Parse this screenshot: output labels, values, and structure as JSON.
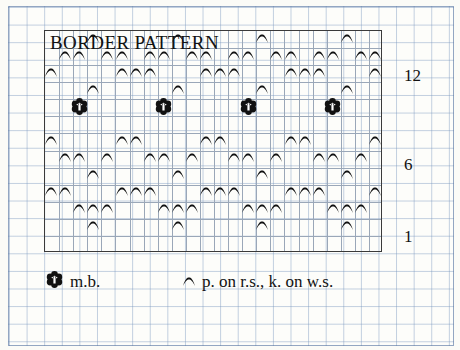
{
  "chart": {
    "title": "BORDER PATTERN",
    "row_labels": [
      {
        "text": "12",
        "row": 12
      },
      {
        "text": "6",
        "row": 6
      },
      {
        "text": "1",
        "row": 1
      }
    ],
    "grid": {
      "columns": 24,
      "rows": 13
    },
    "legend": [
      {
        "symbol": "m.b.-icon",
        "label": "m.b."
      },
      {
        "symbol": "purl-icon",
        "label": "p. on r.s., k. on w.s."
      }
    ]
  },
  "chart_data": {
    "type": "table",
    "title": "BORDER PATTERN",
    "xlabel": "",
    "ylabel": "",
    "symbols": {
      "purl": "p. on r.s., k. on w.s.",
      "bobble": "m.b."
    },
    "rows": [
      {
        "row": 13,
        "purl": [
          4,
          10,
          16,
          22
        ],
        "bobble": []
      },
      {
        "row": 12,
        "purl": [
          2,
          3,
          5,
          6,
          8,
          9,
          11,
          12,
          14,
          15,
          17,
          18,
          20,
          21,
          23,
          24
        ],
        "bobble": []
      },
      {
        "row": 11,
        "purl": [
          1,
          6,
          7,
          8,
          12,
          13,
          14,
          18,
          19,
          20,
          24
        ],
        "bobble": []
      },
      {
        "row": 10,
        "purl": [
          4,
          10,
          16,
          22
        ],
        "bobble": []
      },
      {
        "row": 9,
        "purl": [],
        "bobble": [
          3,
          9,
          15,
          21
        ]
      },
      {
        "row": 8,
        "purl": [],
        "bobble": []
      },
      {
        "row": 7,
        "purl": [
          1,
          6,
          7,
          12,
          13,
          18,
          19,
          24
        ],
        "bobble": []
      },
      {
        "row": 6,
        "purl": [
          2,
          3,
          5,
          8,
          9,
          11,
          14,
          15,
          17,
          20,
          21,
          23
        ],
        "bobble": []
      },
      {
        "row": 5,
        "purl": [
          4,
          10,
          16,
          22
        ],
        "bobble": []
      },
      {
        "row": 4,
        "purl": [
          1,
          2,
          6,
          7,
          8,
          12,
          13,
          14,
          18,
          19,
          20,
          24
        ],
        "bobble": []
      },
      {
        "row": 3,
        "purl": [
          3,
          4,
          5,
          9,
          10,
          11,
          15,
          16,
          17,
          21,
          22,
          23
        ],
        "bobble": []
      },
      {
        "row": 2,
        "purl": [
          4,
          10,
          16,
          22
        ],
        "bobble": []
      },
      {
        "row": 1,
        "purl": [],
        "bobble": []
      }
    ]
  }
}
